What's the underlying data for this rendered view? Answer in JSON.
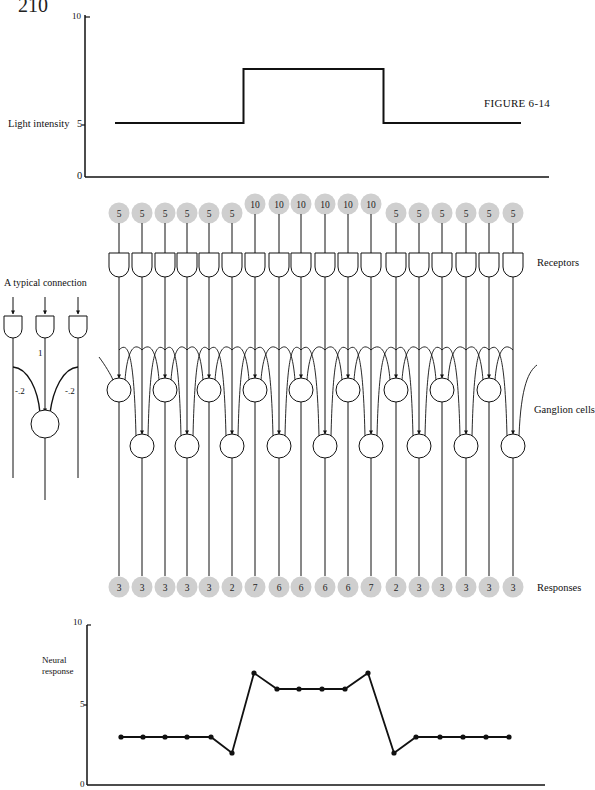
{
  "page": {
    "number": "210",
    "figure_label": "FIGURE 6-14"
  },
  "top_chart": {
    "ylabel": "Light intensity",
    "yticks": [
      "0",
      "5",
      "10"
    ]
  },
  "diagram": {
    "typical_connection": {
      "title": "A typical connection",
      "center_weight": "1",
      "left_weight": "-.2",
      "right_weight": "-.2"
    },
    "row_labels": {
      "receptors": "Receptors",
      "ganglion": "Ganglion cells",
      "responses": "Responses"
    },
    "receptor_values": [
      "5",
      "5",
      "5",
      "5",
      "5",
      "5",
      "10",
      "10",
      "10",
      "10",
      "10",
      "10",
      "5",
      "5",
      "5",
      "5",
      "5",
      "5"
    ],
    "response_values": [
      "3",
      "3",
      "3",
      "3",
      "3",
      "2",
      "7",
      "6",
      "6",
      "6",
      "6",
      "7",
      "2",
      "3",
      "3",
      "3",
      "3",
      "3"
    ]
  },
  "bottom_chart": {
    "ylabel_line1": "Neural",
    "ylabel_line2": "response",
    "yticks": [
      "0",
      "5",
      "10"
    ]
  },
  "chart_data": [
    {
      "type": "line",
      "title": "Light intensity stimulus",
      "xlabel": "",
      "ylabel": "Light intensity",
      "ylim": [
        0,
        10
      ],
      "yticks": [
        0,
        5,
        10
      ],
      "grid": false,
      "x": [
        1,
        2,
        3,
        4,
        5,
        6,
        7,
        8,
        9,
        10,
        11,
        12,
        13,
        14,
        15,
        16,
        17,
        18
      ],
      "series": [
        {
          "name": "Light intensity",
          "values": [
            5,
            5,
            5,
            5,
            5,
            5,
            10,
            10,
            10,
            10,
            10,
            10,
            5,
            5,
            5,
            5,
            5,
            5
          ],
          "style": "step"
        }
      ]
    },
    {
      "type": "line",
      "title": "Neural response",
      "xlabel": "",
      "ylabel": "Neural response",
      "ylim": [
        0,
        10
      ],
      "yticks": [
        0,
        5,
        10
      ],
      "grid": false,
      "x": [
        1,
        2,
        3,
        4,
        5,
        6,
        7,
        8,
        9,
        10,
        11,
        12,
        13,
        14,
        15,
        16,
        17,
        18
      ],
      "series": [
        {
          "name": "Neural response",
          "values": [
            3,
            3,
            3,
            3,
            3,
            2,
            7,
            6,
            6,
            6,
            6,
            7,
            2,
            3,
            3,
            3,
            3,
            3
          ],
          "markers": true
        }
      ]
    }
  ]
}
